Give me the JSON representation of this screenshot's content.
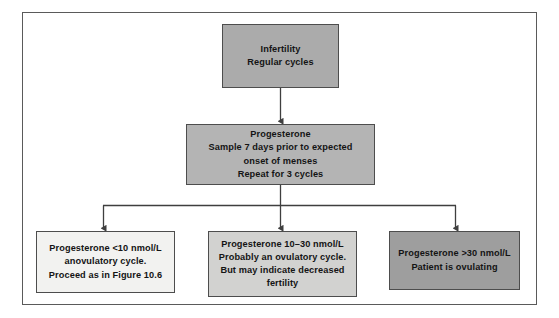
{
  "figure": {
    "type": "clinical-flowchart",
    "title_text": "",
    "frame_label": "figure-border"
  },
  "nodes": {
    "start": {
      "id": "infertility-regular-cycles",
      "text": "Infertility\nRegular cycles",
      "fill": "#ababab"
    },
    "test": {
      "id": "progesterone-test",
      "text": "Progesterone\nSample 7 days prior to expected\nonset of menses\nRepeat for 3 cycles",
      "fill": "#b4b4b4"
    },
    "low": {
      "id": "progesterone-low",
      "text": "Progesterone <10 nmol/L\nanovulatory cycle.\nProceed as in Figure 10.6",
      "fill": "#f2f2f0"
    },
    "mid": {
      "id": "progesterone-mid",
      "text": "Progesterone 10–30 nmol/L\nProbably an ovulatory cycle.\nBut may indicate decreased\nfertility",
      "fill": "#d2d2d0"
    },
    "high": {
      "id": "progesterone-high",
      "text": "Progesterone >30 nmol/L\nPatient is ovulating",
      "fill": "#9e9e9e"
    }
  },
  "connectors": {
    "stroke": "#3f3f3f",
    "items": [
      {
        "name": "start-to-test",
        "kind": "arrow-down"
      },
      {
        "name": "test-to-split",
        "kind": "arrow-down-to-bus"
      },
      {
        "name": "split-bus",
        "kind": "horizontal-bus"
      },
      {
        "name": "bus-to-low",
        "kind": "arrow-down"
      },
      {
        "name": "bus-to-mid",
        "kind": "arrow-down"
      },
      {
        "name": "bus-to-high",
        "kind": "arrow-down"
      }
    ]
  }
}
